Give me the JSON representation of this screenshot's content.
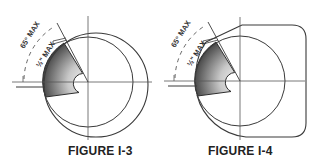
{
  "figures": [
    {
      "id": "I-3",
      "caption": "FIGURE I-3",
      "labels": {
        "outer_angle": "65° MAX",
        "inner_angle": "½\" MAX"
      },
      "shape": "offset-circles"
    },
    {
      "id": "I-4",
      "caption": "FIGURE I-4",
      "labels": {
        "outer_angle": "65° MAX",
        "inner_angle": "½\" MAX"
      },
      "shape": "rounded-square-with-chamfer"
    }
  ],
  "colors": {
    "line": "#3a3a3a",
    "shade_dark": "#4a4a4a",
    "shade_light": "#f2f2f2",
    "text": "#222222"
  }
}
